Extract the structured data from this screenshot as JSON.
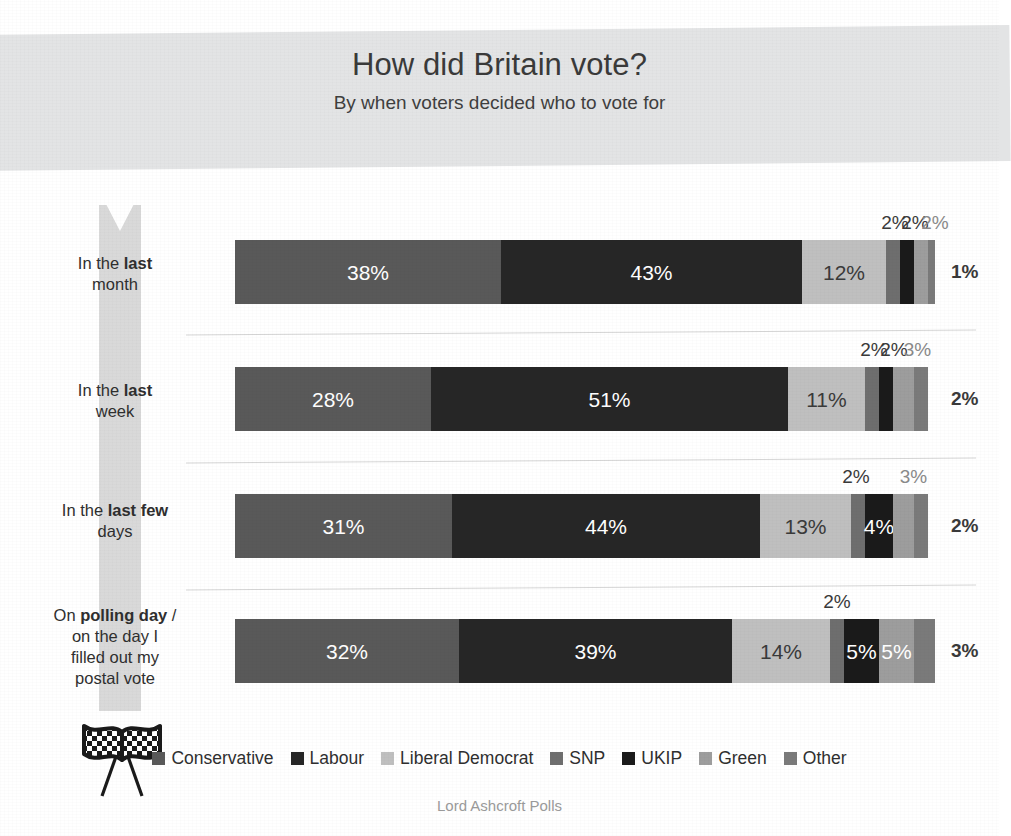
{
  "header": {
    "title": "How did Britain vote?",
    "subtitle": "By when voters decided who to vote for"
  },
  "footer": {
    "credit": "Lord Ashcroft Polls"
  },
  "icons": {
    "ribbon": "timeline-ribbon-icon",
    "flags": "checkered-flags-icon"
  },
  "colors": {
    "header_band": "#e3e4e5",
    "ribbon": "#d9d9d9",
    "divider": "#d6d6d6",
    "conservative": "#595959",
    "labour": "#262626",
    "liberal_democrat": "#bfbfbf",
    "snp": "#6e6e6e",
    "ukip": "#1a1a1a",
    "green": "#9d9d9d",
    "other": "#7a7a7a",
    "label_dark": "#3a3a3a",
    "label_light": "#ffffff"
  },
  "chart_data": {
    "type": "bar",
    "orientation": "horizontal",
    "stacked": true,
    "normalized_percent": true,
    "title": "How did Britain vote?",
    "subtitle": "By when voters decided who to vote for",
    "xlabel": "",
    "ylabel": "",
    "xlim": [
      0,
      100
    ],
    "grid": false,
    "legend_position": "bottom",
    "value_suffix": "%",
    "categories": [
      "In the last month",
      "In the last week",
      "In the last few days",
      "On polling day / on the day I filled out my postal vote"
    ],
    "series": [
      {
        "name": "Conservative",
        "color": "#595959",
        "values": [
          38,
          28,
          31,
          32
        ]
      },
      {
        "name": "Labour",
        "color": "#262626",
        "values": [
          43,
          51,
          44,
          39
        ]
      },
      {
        "name": "Liberal Democrat",
        "color": "#bfbfbf",
        "values": [
          12,
          11,
          13,
          14
        ]
      },
      {
        "name": "SNP",
        "color": "#6e6e6e",
        "values": [
          2,
          2,
          2,
          2
        ]
      },
      {
        "name": "UKIP",
        "color": "#1a1a1a",
        "values": [
          2,
          2,
          4,
          5
        ]
      },
      {
        "name": "Green",
        "color": "#9d9d9d",
        "values": [
          2,
          3,
          3,
          5
        ]
      },
      {
        "name": "Other",
        "color": "#7a7a7a",
        "values": [
          1,
          2,
          2,
          3
        ]
      }
    ]
  },
  "rows": [
    {
      "label_html": "In the <b>last</b><br>month",
      "label_text": "In the last month",
      "segments": [
        {
          "party": "Conservative",
          "value": 38,
          "label": "38%",
          "placement": "inside",
          "text_color": "#ffffff"
        },
        {
          "party": "Labour",
          "value": 43,
          "label": "43%",
          "placement": "inside",
          "text_color": "#ffffff"
        },
        {
          "party": "Liberal Democrat",
          "value": 12,
          "label": "12%",
          "placement": "inside",
          "text_color": "#3a3a3a"
        },
        {
          "party": "SNP",
          "value": 2,
          "label": "2%",
          "placement": "above",
          "text_color": "#3a3a3a"
        },
        {
          "party": "UKIP",
          "value": 2,
          "label": "2%",
          "placement": "above",
          "text_color": "#3a3a3a"
        },
        {
          "party": "Green",
          "value": 2,
          "label": "2%",
          "placement": "above",
          "text_color": "#8a8a8a"
        },
        {
          "party": "Other",
          "value": 1,
          "label": "1%",
          "placement": "right",
          "text_color": "#3a3a3a"
        }
      ]
    },
    {
      "label_html": "In the <b>last</b><br>week",
      "label_text": "In the last week",
      "segments": [
        {
          "party": "Conservative",
          "value": 28,
          "label": "28%",
          "placement": "inside",
          "text_color": "#ffffff"
        },
        {
          "party": "Labour",
          "value": 51,
          "label": "51%",
          "placement": "inside",
          "text_color": "#ffffff"
        },
        {
          "party": "Liberal Democrat",
          "value": 11,
          "label": "11%",
          "placement": "inside",
          "text_color": "#3a3a3a"
        },
        {
          "party": "SNP",
          "value": 2,
          "label": "2%",
          "placement": "above",
          "text_color": "#3a3a3a"
        },
        {
          "party": "UKIP",
          "value": 2,
          "label": "2%",
          "placement": "above",
          "text_color": "#3a3a3a"
        },
        {
          "party": "Green",
          "value": 3,
          "label": "3%",
          "placement": "above",
          "text_color": "#8a8a8a"
        },
        {
          "party": "Other",
          "value": 2,
          "label": "2%",
          "placement": "right",
          "text_color": "#3a3a3a"
        }
      ]
    },
    {
      "label_html": "In the <b>last few</b><br>days",
      "label_text": "In the last few days",
      "segments": [
        {
          "party": "Conservative",
          "value": 31,
          "label": "31%",
          "placement": "inside",
          "text_color": "#ffffff"
        },
        {
          "party": "Labour",
          "value": 44,
          "label": "44%",
          "placement": "inside",
          "text_color": "#ffffff"
        },
        {
          "party": "Liberal Democrat",
          "value": 13,
          "label": "13%",
          "placement": "inside",
          "text_color": "#3a3a3a"
        },
        {
          "party": "SNP",
          "value": 2,
          "label": "2%",
          "placement": "above",
          "text_color": "#3a3a3a"
        },
        {
          "party": "UKIP",
          "value": 4,
          "label": "4%",
          "placement": "inside",
          "text_color": "#ffffff"
        },
        {
          "party": "Green",
          "value": 3,
          "label": "3%",
          "placement": "above",
          "text_color": "#8a8a8a"
        },
        {
          "party": "Other",
          "value": 2,
          "label": "2%",
          "placement": "right",
          "text_color": "#3a3a3a"
        }
      ]
    },
    {
      "label_html": "On <b>polling day</b> /<br>on the day I<br>filled out my<br>postal vote",
      "label_text": "On polling day / on the day I filled out my postal vote",
      "segments": [
        {
          "party": "Conservative",
          "value": 32,
          "label": "32%",
          "placement": "inside",
          "text_color": "#ffffff"
        },
        {
          "party": "Labour",
          "value": 39,
          "label": "39%",
          "placement": "inside",
          "text_color": "#ffffff"
        },
        {
          "party": "Liberal Democrat",
          "value": 14,
          "label": "14%",
          "placement": "inside",
          "text_color": "#3a3a3a"
        },
        {
          "party": "SNP",
          "value": 2,
          "label": "2%",
          "placement": "above",
          "text_color": "#3a3a3a"
        },
        {
          "party": "UKIP",
          "value": 5,
          "label": "5%",
          "placement": "inside",
          "text_color": "#ffffff"
        },
        {
          "party": "Green",
          "value": 5,
          "label": "5%",
          "placement": "inside",
          "text_color": "#ffffff"
        },
        {
          "party": "Other",
          "value": 3,
          "label": "3%",
          "placement": "right",
          "text_color": "#3a3a3a"
        }
      ]
    }
  ],
  "legend": {
    "items": [
      {
        "label": "Conservative",
        "color": "#595959"
      },
      {
        "label": "Labour",
        "color": "#262626"
      },
      {
        "label": "Liberal Democrat",
        "color": "#bfbfbf"
      },
      {
        "label": "SNP",
        "color": "#6e6e6e"
      },
      {
        "label": "UKIP",
        "color": "#1a1a1a"
      },
      {
        "label": "Green",
        "color": "#9d9d9d"
      },
      {
        "label": "Other",
        "color": "#7a7a7a"
      }
    ]
  }
}
